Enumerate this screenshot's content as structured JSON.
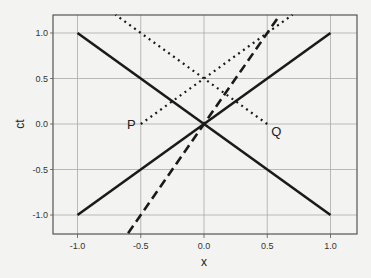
{
  "chart_data": {
    "type": "line",
    "title": "",
    "xlabel": "x",
    "ylabel": "ct",
    "xlim": [
      -1.19,
      1.21
    ],
    "ylim": [
      -1.2,
      1.2
    ],
    "grid": true,
    "legend": null,
    "x_ticks": [
      "-1.0",
      "-0.5",
      "0.0",
      "0.5",
      "1.0"
    ],
    "y_ticks": [
      "1.0",
      "0.5",
      "0.0",
      "-0.5",
      "-1.0"
    ],
    "series": [
      {
        "name": "light line ct = -x",
        "style": "solid",
        "x": [
          -1.0,
          1.0
        ],
        "y": [
          1.0,
          -1.0
        ]
      },
      {
        "name": "light line ct = x",
        "style": "solid",
        "x": [
          -1.0,
          1.0
        ],
        "y": [
          -1.0,
          1.0
        ]
      },
      {
        "name": "worldline ct = 2x",
        "style": "dashed",
        "x": [
          -0.6,
          0.6
        ],
        "y": [
          -1.2,
          1.2
        ]
      },
      {
        "name": "light ray from P",
        "style": "dotted",
        "x": [
          -0.5,
          0.7
        ],
        "y": [
          0.0,
          1.2
        ]
      },
      {
        "name": "light ray from Q",
        "style": "dotted",
        "x": [
          0.5,
          -0.7
        ],
        "y": [
          0.0,
          1.2
        ]
      }
    ],
    "annotations": [
      {
        "text": "P",
        "x": -0.5,
        "y": 0.0
      },
      {
        "text": "Q",
        "x": 0.5,
        "y": 0.0
      }
    ]
  }
}
